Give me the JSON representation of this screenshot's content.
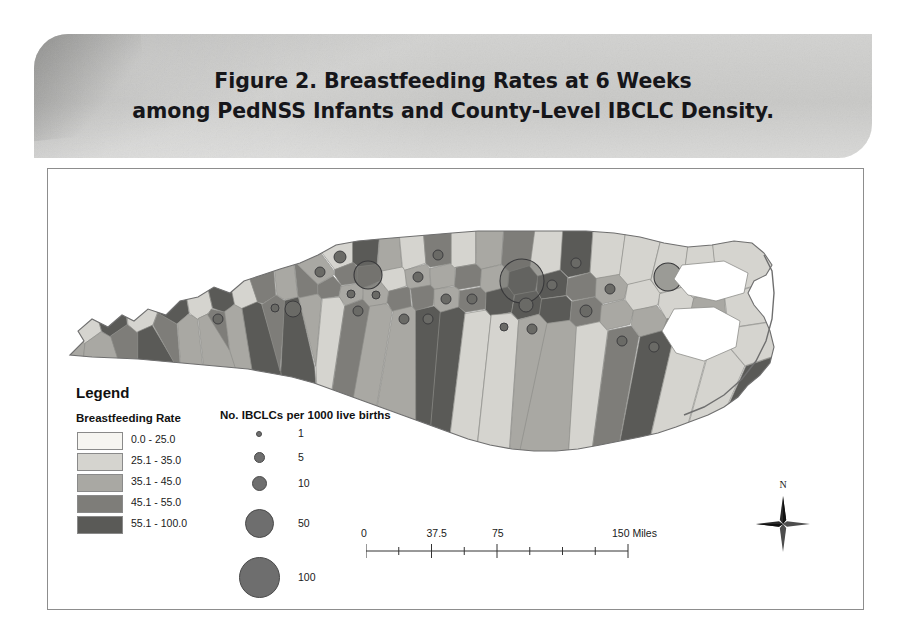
{
  "figure": {
    "title_line1": "Figure 2. Breastfeeding Rates at 6 Weeks",
    "title_line2": "among PedNSS Infants and County-Level IBCLC Density.",
    "banner_color": "#c9c9c7",
    "frame_color": "#8d8d8d"
  },
  "legend": {
    "heading": "Legend",
    "rate_heading": "Breastfeeding Rate",
    "bubble_heading": "No. IBCLCs per 1000 live births",
    "rate_classes": [
      {
        "label": "0.0 - 25.0",
        "color": "#f6f5f1"
      },
      {
        "label": "25.1 - 35.0",
        "color": "#d5d4cf"
      },
      {
        "label": "35.1 - 45.0",
        "color": "#a9a8a3"
      },
      {
        "label": "45.1 - 55.0",
        "color": "#7e7d79"
      },
      {
        "label": "55.1 - 100.0",
        "color": "#5a5a57"
      }
    ],
    "bubble_classes": [
      {
        "label": "1",
        "radius": 2.0
      },
      {
        "label": "5",
        "radius": 4.5
      },
      {
        "label": "10",
        "radius": 6.5
      },
      {
        "label": "50",
        "radius": 13.5
      },
      {
        "label": "100",
        "radius": 19.5
      }
    ]
  },
  "scalebar": {
    "ticks": [
      "0",
      "37.5",
      "75",
      "150 Miles"
    ],
    "tick_positions": [
      0,
      0.25,
      0.5,
      1.0
    ],
    "minor_count": 8
  },
  "compass": {
    "north_label": "N"
  },
  "chart_data": {
    "type": "map",
    "map_subject": "North Carolina counties",
    "choropleth_variable": "Breastfeeding rate at 6 weeks (%)",
    "bubble_variable": "No. IBCLCs per 1000 live births",
    "class_colors": [
      "#f6f5f1",
      "#d5d4cf",
      "#a9a8a3",
      "#7e7d79",
      "#5a5a57"
    ],
    "class_labels": [
      "0.0 - 25.0",
      "25.1 - 35.0",
      "35.1 - 45.0",
      "45.1 - 55.0",
      "55.1 - 100.0"
    ],
    "counties": [
      {
        "x": 22,
        "y": 175,
        "cls": 2,
        "bub": 0
      },
      {
        "x": 38,
        "y": 160,
        "cls": 1,
        "bub": 0
      },
      {
        "x": 52,
        "y": 178,
        "cls": 2,
        "bub": 0
      },
      {
        "x": 66,
        "y": 152,
        "cls": 4,
        "bub": 0
      },
      {
        "x": 78,
        "y": 170,
        "cls": 3,
        "bub": 0
      },
      {
        "x": 92,
        "y": 150,
        "cls": 1,
        "bub": 0
      },
      {
        "x": 101,
        "y": 170,
        "cls": 4,
        "bub": 0
      },
      {
        "x": 118,
        "y": 160,
        "cls": 3,
        "bub": 0
      },
      {
        "x": 128,
        "y": 142,
        "cls": 4,
        "bub": 0
      },
      {
        "x": 141,
        "y": 158,
        "cls": 2,
        "bub": 0
      },
      {
        "x": 152,
        "y": 138,
        "cls": 1,
        "bub": 0
      },
      {
        "x": 160,
        "y": 156,
        "cls": 2,
        "bub": 0
      },
      {
        "x": 174,
        "y": 133,
        "cls": 4,
        "bub": 0
      },
      {
        "x": 170,
        "y": 150,
        "cls": 3,
        "bub": 5
      },
      {
        "x": 186,
        "y": 148,
        "cls": 2,
        "bub": 0
      },
      {
        "x": 198,
        "y": 128,
        "cls": 1,
        "bub": 0
      },
      {
        "x": 205,
        "y": 145,
        "cls": 4,
        "bub": 0
      },
      {
        "x": 216,
        "y": 122,
        "cls": 3,
        "bub": 0
      },
      {
        "x": 227,
        "y": 139,
        "cls": 3,
        "bub": 4
      },
      {
        "x": 240,
        "y": 120,
        "cls": 2,
        "bub": 0
      },
      {
        "x": 245,
        "y": 140,
        "cls": 4,
        "bub": 8
      },
      {
        "x": 258,
        "y": 118,
        "cls": 3,
        "bub": 0
      },
      {
        "x": 262,
        "y": 136,
        "cls": 2,
        "bub": 0
      },
      {
        "x": 272,
        "y": 103,
        "cls": 2,
        "bub": 5
      },
      {
        "x": 282,
        "y": 120,
        "cls": 3,
        "bub": 0
      },
      {
        "x": 284,
        "y": 138,
        "cls": 1,
        "bub": 0
      },
      {
        "x": 292,
        "y": 88,
        "cls": 1,
        "bub": 6
      },
      {
        "x": 300,
        "y": 106,
        "cls": 3,
        "bub": 0
      },
      {
        "x": 303,
        "y": 125,
        "cls": 2,
        "bub": 4
      },
      {
        "x": 310,
        "y": 142,
        "cls": 3,
        "bub": 5
      },
      {
        "x": 318,
        "y": 88,
        "cls": 4,
        "bub": 0
      },
      {
        "x": 320,
        "y": 106,
        "cls": 3,
        "bub": 14
      },
      {
        "x": 328,
        "y": 126,
        "cls": 2,
        "bub": 4
      },
      {
        "x": 332,
        "y": 146,
        "cls": 2,
        "bub": 0
      },
      {
        "x": 342,
        "y": 90,
        "cls": 2,
        "bub": 0
      },
      {
        "x": 346,
        "y": 110,
        "cls": 1,
        "bub": 0
      },
      {
        "x": 352,
        "y": 130,
        "cls": 3,
        "bub": 0
      },
      {
        "x": 356,
        "y": 150,
        "cls": 2,
        "bub": 5
      },
      {
        "x": 364,
        "y": 88,
        "cls": 1,
        "bub": 0
      },
      {
        "x": 370,
        "y": 108,
        "cls": 2,
        "bub": 5
      },
      {
        "x": 374,
        "y": 128,
        "cls": 3,
        "bub": 0
      },
      {
        "x": 380,
        "y": 150,
        "cls": 4,
        "bub": 5
      },
      {
        "x": 390,
        "y": 86,
        "cls": 3,
        "bub": 5
      },
      {
        "x": 394,
        "y": 108,
        "cls": 2,
        "bub": 0
      },
      {
        "x": 398,
        "y": 130,
        "cls": 2,
        "bub": 5
      },
      {
        "x": 404,
        "y": 152,
        "cls": 4,
        "bub": 0
      },
      {
        "x": 416,
        "y": 86,
        "cls": 1,
        "bub": 0
      },
      {
        "x": 420,
        "y": 108,
        "cls": 3,
        "bub": 0
      },
      {
        "x": 424,
        "y": 130,
        "cls": 3,
        "bub": 5
      },
      {
        "x": 428,
        "y": 155,
        "cls": 1,
        "bub": 0
      },
      {
        "x": 440,
        "y": 86,
        "cls": 2,
        "bub": 0
      },
      {
        "x": 446,
        "y": 110,
        "cls": 2,
        "bub": 0
      },
      {
        "x": 452,
        "y": 132,
        "cls": 4,
        "bub": 0
      },
      {
        "x": 456,
        "y": 158,
        "cls": 1,
        "bub": 4
      },
      {
        "x": 468,
        "y": 88,
        "cls": 3,
        "bub": 0
      },
      {
        "x": 474,
        "y": 112,
        "cls": 4,
        "bub": 22
      },
      {
        "x": 478,
        "y": 136,
        "cls": 4,
        "bub": 7
      },
      {
        "x": 484,
        "y": 160,
        "cls": 2,
        "bub": 5
      },
      {
        "x": 498,
        "y": 92,
        "cls": 1,
        "bub": 0
      },
      {
        "x": 504,
        "y": 116,
        "cls": 4,
        "bub": 5
      },
      {
        "x": 508,
        "y": 140,
        "cls": 4,
        "bub": 0
      },
      {
        "x": 512,
        "y": 166,
        "cls": 2,
        "bub": 0
      },
      {
        "x": 528,
        "y": 94,
        "cls": 4,
        "bub": 5
      },
      {
        "x": 534,
        "y": 118,
        "cls": 3,
        "bub": 0
      },
      {
        "x": 538,
        "y": 142,
        "cls": 3,
        "bub": 6
      },
      {
        "x": 544,
        "y": 168,
        "cls": 1,
        "bub": 0
      },
      {
        "x": 558,
        "y": 96,
        "cls": 1,
        "bub": 0
      },
      {
        "x": 562,
        "y": 120,
        "cls": 2,
        "bub": 5
      },
      {
        "x": 568,
        "y": 146,
        "cls": 2,
        "bub": 0
      },
      {
        "x": 574,
        "y": 172,
        "cls": 3,
        "bub": 5
      },
      {
        "x": 588,
        "y": 100,
        "cls": 1,
        "bub": 0
      },
      {
        "x": 594,
        "y": 126,
        "cls": 1,
        "bub": 0
      },
      {
        "x": 600,
        "y": 152,
        "cls": 2,
        "bub": 0
      },
      {
        "x": 606,
        "y": 178,
        "cls": 4,
        "bub": 5
      },
      {
        "x": 620,
        "y": 108,
        "cls": 1,
        "bub": 14
      },
      {
        "x": 628,
        "y": 134,
        "cls": 1,
        "bub": 0
      },
      {
        "x": 634,
        "y": 160,
        "cls": 3,
        "bub": 14
      },
      {
        "x": 640,
        "y": 186,
        "cls": 1,
        "bub": 0
      },
      {
        "x": 652,
        "y": 112,
        "cls": 1,
        "bub": 13
      },
      {
        "x": 660,
        "y": 140,
        "cls": 2,
        "bub": 0
      },
      {
        "x": 668,
        "y": 166,
        "cls": 4,
        "bub": 8
      },
      {
        "x": 676,
        "y": 196,
        "cls": 1,
        "bub": 0
      },
      {
        "x": 686,
        "y": 108,
        "cls": 1,
        "bub": 0
      },
      {
        "x": 694,
        "y": 136,
        "cls": 1,
        "bub": 0
      },
      {
        "x": 700,
        "y": 176,
        "cls": 1,
        "bub": 0
      },
      {
        "x": 712,
        "y": 212,
        "cls": 4,
        "bub": 5
      }
    ]
  }
}
